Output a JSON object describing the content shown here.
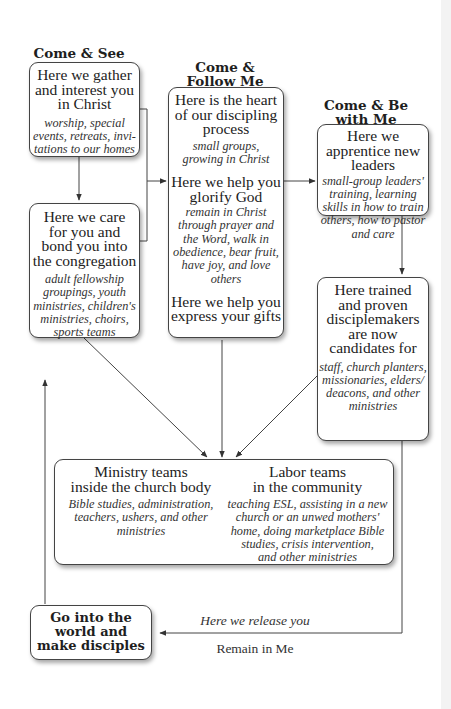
{
  "stages": {
    "come_see": {
      "heading": "Come & See",
      "box": {
        "main": [
          "Here we gather",
          "and interest you",
          "in Christ"
        ],
        "sub": [
          "worship, special",
          "events, retreats, invi-",
          "tations to our homes"
        ]
      },
      "care_box": {
        "main": [
          "Here we care",
          "for you and",
          "bond you into",
          "the congregation"
        ],
        "sub": [
          "adult fellowship",
          "groupings, youth",
          "ministries, children's",
          "ministries, choirs,",
          "sports teams"
        ]
      }
    },
    "come_follow": {
      "heading": [
        "Come &",
        "Follow Me"
      ],
      "sections": [
        {
          "main": [
            "Here is the heart",
            "of our discipling",
            "process"
          ],
          "sub": [
            "small groups,",
            "growing in Christ"
          ]
        },
        {
          "main": [
            "Here we help you",
            "glorify God"
          ],
          "sub": [
            "remain in Christ",
            "through prayer and",
            "the Word, walk in",
            "obedience, bear fruit,",
            "have joy, and love",
            "others"
          ]
        },
        {
          "main": [
            "Here we help you",
            "express your gifts"
          ],
          "sub": []
        }
      ]
    },
    "come_be_with": {
      "heading": [
        "Come & Be",
        "with Me"
      ],
      "box": {
        "main": [
          "Here we",
          "apprentice new",
          "leaders"
        ],
        "sub": [
          "small-group leaders'",
          "training, learning",
          "skills in how to train",
          "others, how to pastor",
          "and care"
        ]
      },
      "candidates_box": {
        "main": [
          "Here trained",
          "and proven",
          "disciplemakers",
          "are now",
          "candidates for"
        ],
        "sub": [
          "staff, church planters,",
          "missionaries, elders/",
          "deacons, and other",
          "ministries"
        ]
      }
    }
  },
  "teams": {
    "ministry": {
      "title": [
        "Ministry teams",
        "inside the church body"
      ],
      "sub": [
        "Bible studies, administration,",
        "teachers, ushers, and other",
        "ministries"
      ]
    },
    "labor": {
      "title": [
        "Labor teams",
        "in the community"
      ],
      "sub": [
        "teaching ESL, assisting in a new",
        "church or an unwed mothers'",
        "home, doing marketplace Bible",
        "studies, crisis intervention,",
        "and other ministries"
      ]
    }
  },
  "go_box": {
    "lines": [
      "Go into the",
      "world and",
      "make disciples"
    ]
  },
  "release_label": "Here we release you",
  "remain_label": "Remain in Me",
  "colors": {
    "line": "#444444",
    "border": "#444444",
    "text": "#222222"
  }
}
